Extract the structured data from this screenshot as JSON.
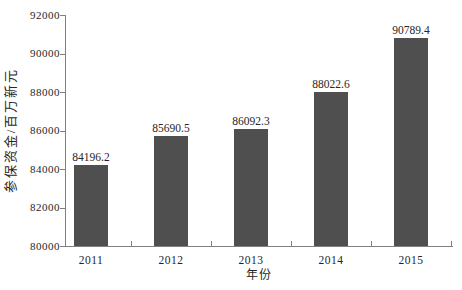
{
  "figure": {
    "background": "#ffffff"
  },
  "chart_data": {
    "type": "bar",
    "categories": [
      "2011",
      "2012",
      "2013",
      "2014",
      "2015"
    ],
    "values": [
      84196.2,
      85690.5,
      86092.3,
      88022.6,
      90789.4
    ],
    "data_labels": [
      "84196.2",
      "85690.5",
      "86092.3",
      "88022.6",
      "90789.4"
    ],
    "title": "",
    "xlabel": "年份",
    "ylabel": "参保资金/百万新元",
    "ylim": [
      80000,
      92000
    ],
    "yticks": [
      80000,
      82000,
      84000,
      86000,
      88000,
      90000,
      92000
    ],
    "ytick_labels": [
      "80000",
      "82000",
      "84000",
      "86000",
      "88000",
      "90000",
      "92000"
    ],
    "grid": "off",
    "legend": "none",
    "bar_color": "#4f4f4f",
    "axis_color": "#808080",
    "text_color": "#262626"
  }
}
